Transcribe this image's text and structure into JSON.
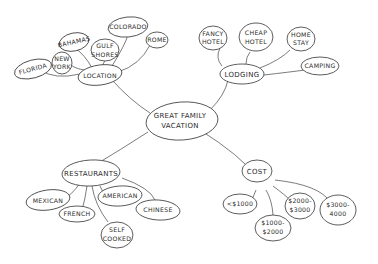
{
  "diagram": {
    "type": "mind-map",
    "center": {
      "label_line1": "GREAT FAMILY",
      "label_line2": "VACATION"
    },
    "branches": {
      "location": {
        "label": "LOCATION",
        "children": {
          "florida": "FLORIDA",
          "new_york_l1": "NEW",
          "new_york_l2": "YORK",
          "bahamas": "BAHAMAS",
          "gulf_shores_l1": "GULF",
          "gulf_shores_l2": "SHORES",
          "colorado": "COLORADO",
          "rome": "ROME"
        }
      },
      "lodging": {
        "label": "LODGING",
        "children": {
          "fancy_hotel_l1": "FANCY",
          "fancy_hotel_l2": "HOTEL",
          "cheap_hotel_l1": "CHEAP",
          "cheap_hotel_l2": "HOTEL",
          "home_stay_l1": "HOME",
          "home_stay_l2": "STAY",
          "camping": "CAMPING"
        }
      },
      "restaurants": {
        "label": "RESTAURANTS",
        "children": {
          "mexican": "MEXICAN",
          "french": "FRENCH",
          "american": "AMERICAN",
          "self_cooked_l1": "SELF",
          "self_cooked_l2": "COOKED",
          "chinese": "CHINESE"
        }
      },
      "cost": {
        "label": "COST",
        "children": {
          "under_1000": "<$1000",
          "range_1000_2000_l1": "$1000-",
          "range_1000_2000_l2": "$2000",
          "range_2000_3000_l1": "$2000-",
          "range_2000_3000_l2": "$3000",
          "range_3000_4000_l1": "$3000-",
          "range_3000_4000_l2": "4000"
        }
      }
    }
  }
}
